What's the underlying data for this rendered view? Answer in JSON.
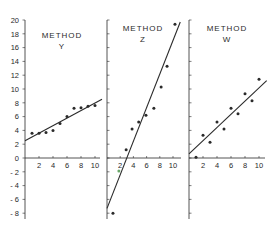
{
  "chart_data": [
    {
      "type": "scatter",
      "title": "METHOD Y",
      "title_lines": [
        "METHOD",
        "Y"
      ],
      "xlabel": "",
      "ylabel": "",
      "xlim": [
        0,
        11
      ],
      "ylim": [
        -9,
        20
      ],
      "xticks": [
        2,
        4,
        6,
        8,
        10
      ],
      "yticks": [
        20,
        18,
        16,
        14,
        12,
        10,
        8,
        6,
        4,
        2,
        0,
        -2,
        -4,
        -6,
        -8
      ],
      "grid": false,
      "x": [
        1,
        2,
        3,
        4,
        5,
        6,
        7,
        8,
        9,
        10
      ],
      "y": [
        3.6,
        3.6,
        3.7,
        4.0,
        5.0,
        6.0,
        7.2,
        7.3,
        7.5,
        7.6
      ],
      "fit_line": {
        "x": [
          0,
          11
        ],
        "y": [
          2.5,
          8.5
        ]
      }
    },
    {
      "type": "scatter",
      "title": "METHOD Z",
      "title_lines": [
        "METHOD",
        "Z"
      ],
      "xlabel": "",
      "ylabel": "",
      "xlim": [
        0,
        11
      ],
      "ylim": [
        -9,
        20
      ],
      "xticks": [
        2,
        4,
        6,
        8,
        10
      ],
      "grid": false,
      "x": [
        0.9,
        1.8,
        2.9,
        3.8,
        4.8,
        5.9,
        7.1,
        8.2,
        9.1,
        10.3
      ],
      "y": [
        -8.0,
        -1.9,
        1.2,
        4.2,
        5.2,
        6.2,
        7.2,
        10.3,
        13.3,
        19.4
      ],
      "fit_line": {
        "x": [
          0,
          11.1
        ],
        "y": [
          -7.3,
          19.7
        ]
      }
    },
    {
      "type": "scatter",
      "title": "METHOD W",
      "title_lines": [
        "METHOD",
        "W"
      ],
      "xlabel": "",
      "ylabel": "",
      "xlim": [
        0,
        11
      ],
      "ylim": [
        -9,
        20
      ],
      "xticks": [
        2,
        4,
        6,
        8,
        10
      ],
      "grid": false,
      "x": [
        1,
        2,
        3,
        4,
        5,
        6,
        7,
        8,
        9,
        10
      ],
      "y": [
        0.1,
        3.3,
        2.3,
        5.2,
        4.2,
        7.2,
        6.4,
        9.3,
        8.3,
        11.4
      ],
      "fit_line": {
        "x": [
          0,
          11.1
        ],
        "y": [
          0.6,
          11.2
        ]
      }
    }
  ],
  "layout": {
    "panel_axis_x": [
      25,
      107,
      189
    ],
    "panel_x_scale": [
      7.0,
      6.6,
      7.0
    ],
    "y_zero_px": 158,
    "y_scale": 6.9,
    "axis_top_px": 20,
    "axis_bottom_px": 219,
    "x_axis_end_px": [
      100,
      181,
      265
    ],
    "colors": {
      "ink": "#2a2a2a",
      "background": "#ffffff",
      "highlight_point": "#6aa86a"
    }
  }
}
